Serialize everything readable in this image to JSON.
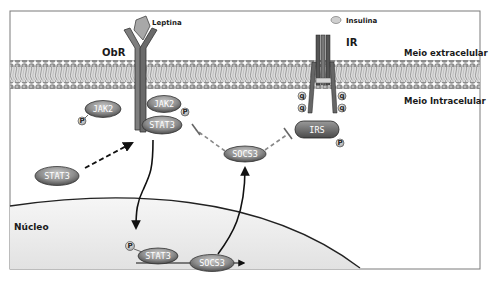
{
  "labels": {
    "ligand_leptin": "Leptina",
    "ligand_insulin": "Insulina",
    "receptor_obr": "ObR",
    "receptor_ir": "IR",
    "extracellular": "Meio extracelular",
    "intracellular": "Meio Intracelular",
    "nucleus": "Núcleo"
  },
  "molecules": {
    "jak2_left": "JAK2",
    "jak2_right": "JAK2",
    "stat3_receptor": "STAT3",
    "stat3_cytosol": "STAT3",
    "socs3_cytosol": "SOCS3",
    "irs": "IRS",
    "stat3_nuclear": "STAT3",
    "socs3_gene": "SOCS3"
  },
  "phospho_marker": "P",
  "ir_phospho_marker": "q",
  "colors": {
    "membrane_head": "#8a8a8a",
    "membrane_tail": "#c8c8c8",
    "molecule_fill": "#8c8c8c",
    "irs_fill": "#6e6e6e",
    "nucleus_fill": "#ececec",
    "frame": "#777777"
  }
}
